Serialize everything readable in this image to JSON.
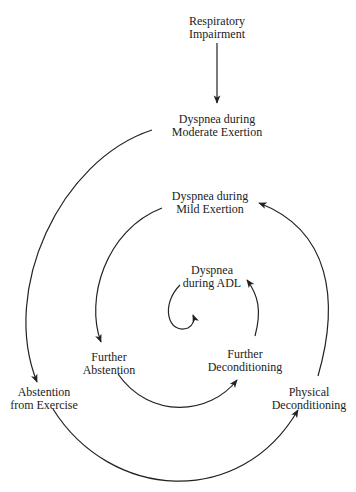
{
  "diagram": {
    "type": "spiral-cycle",
    "colors": {
      "stroke": "#222222",
      "text": "#222222",
      "background": "#ffffff"
    },
    "nodes": {
      "respiratory_impairment": {
        "line1": "Respiratory",
        "line2": "Impairment"
      },
      "dyspnea_moderate": {
        "line1": "Dyspnea during",
        "line2": "Moderate Exertion"
      },
      "dyspnea_mild": {
        "line1": "Dyspnea during",
        "line2": "Mild Exertion"
      },
      "dyspnea_adl": {
        "line1": "Dyspnea",
        "line2": "during ADL"
      },
      "further_abstention": {
        "line1": "Further",
        "line2": "Abstention"
      },
      "further_deconditioning": {
        "line1": "Further",
        "line2": "Deconditioning"
      },
      "abstention_exercise": {
        "line1": "Abstention",
        "line2": "from Exercise"
      },
      "physical_deconditioning": {
        "line1": "Physical",
        "line2": "Deconditioning"
      }
    },
    "edges": [
      {
        "from": "Respiratory Impairment",
        "to": "Dyspnea during Moderate Exertion"
      },
      {
        "from": "Dyspnea during Moderate Exertion",
        "to": "Abstention from Exercise"
      },
      {
        "from": "Abstention from Exercise",
        "to": "Physical Deconditioning"
      },
      {
        "from": "Physical Deconditioning",
        "to": "Dyspnea during Mild Exertion"
      },
      {
        "from": "Dyspnea during Mild Exertion",
        "to": "Further Abstention"
      },
      {
        "from": "Further Abstention",
        "to": "Further Deconditioning"
      },
      {
        "from": "Further Deconditioning",
        "to": "Dyspnea during ADL"
      },
      {
        "from": "Dyspnea during ADL",
        "to": "spiral-center"
      }
    ]
  }
}
